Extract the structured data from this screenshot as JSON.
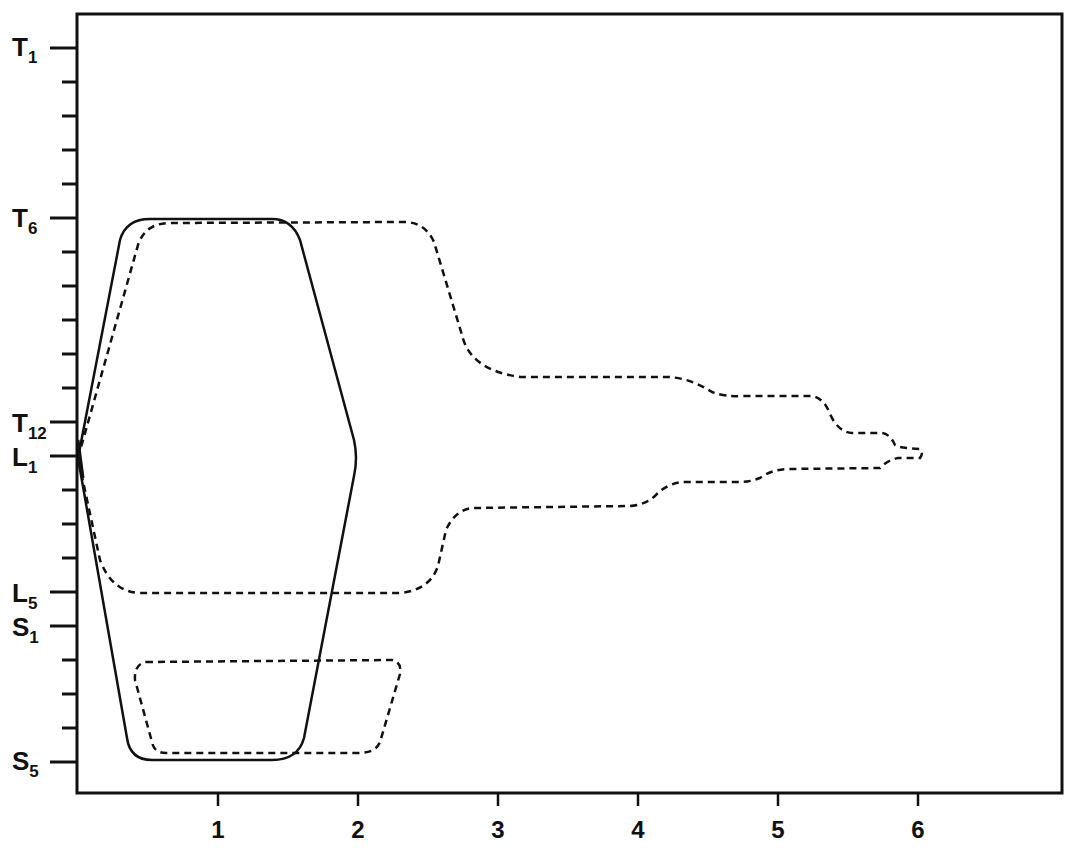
{
  "chart_data": {
    "type": "line",
    "title": "",
    "xlabel": "",
    "ylabel": "",
    "xlim": [
      0,
      7
    ],
    "x_ticks": [
      1,
      2,
      3,
      4,
      5,
      6
    ],
    "y_axis": {
      "orientation": "vertebral level, top to bottom",
      "levels": [
        "T1",
        "T2",
        "T3",
        "T4",
        "T5",
        "T6",
        "T7",
        "T8",
        "T9",
        "T10",
        "T11",
        "T12",
        "L1",
        "L2",
        "L3",
        "L4",
        "L5",
        "S1",
        "S2",
        "S3",
        "S4",
        "S5"
      ],
      "labeled_levels": [
        {
          "main": "T",
          "sub": "1",
          "index": 0
        },
        {
          "main": "T",
          "sub": "6",
          "index": 5
        },
        {
          "main": "T",
          "sub": "12",
          "index": 11
        },
        {
          "main": "L",
          "sub": "1",
          "index": 12
        },
        {
          "main": "L",
          "sub": "5",
          "index": 16
        },
        {
          "main": "S",
          "sub": "1",
          "index": 17
        },
        {
          "main": "S",
          "sub": "5",
          "index": 21
        }
      ]
    },
    "grid": false,
    "legend": null,
    "series": [
      {
        "name": "solid envelope",
        "style": "solid",
        "description": "Hexagonal spread from L1 origin: rises to T6 and descends to S5, max width ~2 at L1",
        "points": [
          {
            "x": 0,
            "level": "L1"
          },
          {
            "x": 0.35,
            "level": "T7"
          },
          {
            "x": 0.6,
            "level": "T6"
          },
          {
            "x": 1.45,
            "level": "T6"
          },
          {
            "x": 1.6,
            "level": "T7"
          },
          {
            "x": 2.0,
            "level": "L1"
          },
          {
            "x": 1.6,
            "level": "S4"
          },
          {
            "x": 1.4,
            "level": "S5"
          },
          {
            "x": 0.55,
            "level": "S5"
          },
          {
            "x": 0.35,
            "level": "S4"
          },
          {
            "x": 0,
            "level": "L1"
          }
        ]
      },
      {
        "name": "dashed envelope (upper/lumbar)",
        "style": "dashed",
        "description": "Spread from L1 origin extending upward to T6 and downward to L5, with stepwise taper reaching x~6 at L1",
        "points": [
          {
            "x": 0,
            "level": "L1"
          },
          {
            "x": 0.55,
            "level": "T6"
          },
          {
            "x": 2.45,
            "level": "T6"
          },
          {
            "x": 2.7,
            "level": "T10"
          },
          {
            "x": 4.3,
            "level": "T10"
          },
          {
            "x": 5.2,
            "level": "T11"
          },
          {
            "x": 5.4,
            "level": "T12"
          },
          {
            "x": 5.8,
            "level": "T12"
          },
          {
            "x": 6.0,
            "level": "L1"
          },
          {
            "x": 5.8,
            "level": "L1"
          },
          {
            "x": 5.0,
            "level": "L1"
          },
          {
            "x": 4.3,
            "level": "L2"
          },
          {
            "x": 4.0,
            "level": "L2"
          },
          {
            "x": 2.8,
            "level": "L2"
          },
          {
            "x": 2.5,
            "level": "L5"
          },
          {
            "x": 0.5,
            "level": "L5"
          },
          {
            "x": 0,
            "level": "L1"
          }
        ]
      },
      {
        "name": "dashed envelope (sacral)",
        "style": "dashed",
        "description": "Closed sacral loop spanning S2 to S5, x ~0.4 to ~2.3",
        "points": [
          {
            "x": 0.45,
            "level": "S2"
          },
          {
            "x": 2.25,
            "level": "S2"
          },
          {
            "x": 2.0,
            "level": "S5"
          },
          {
            "x": 0.6,
            "level": "S5"
          },
          {
            "x": 0.45,
            "level": "S2"
          }
        ]
      }
    ]
  },
  "axes": {
    "x_tick_labels": [
      "1",
      "2",
      "3",
      "4",
      "5",
      "6"
    ],
    "y_labels": [
      {
        "main": "T",
        "sub": "1"
      },
      {
        "main": "T",
        "sub": "6"
      },
      {
        "main": "T",
        "sub": "12"
      },
      {
        "main": "L",
        "sub": "1"
      },
      {
        "main": "L",
        "sub": "5"
      },
      {
        "main": "S",
        "sub": "1"
      },
      {
        "main": "S",
        "sub": "5"
      }
    ]
  }
}
